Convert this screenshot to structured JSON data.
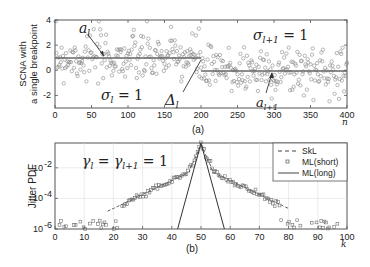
{
  "chart_data": [
    {
      "panel": "(a)",
      "type": "scatter",
      "ylabel": "SCNA with a single breakpoint",
      "xlabel": "n",
      "xlim": [
        0,
        400
      ],
      "ylim": [
        -3,
        4
      ],
      "xticks": [
        0,
        50,
        100,
        150,
        200,
        250,
        300,
        350,
        400
      ],
      "yticks": [
        -2,
        0,
        2,
        4
      ],
      "series": [
        {
          "name": "observations",
          "marker": "circle",
          "description": "noisy samples around piecewise-constant level"
        },
        {
          "name": "segment level l",
          "x": [
            0,
            200
          ],
          "y": [
            1,
            1
          ]
        },
        {
          "name": "segment level l+1",
          "x": [
            200,
            400
          ],
          "y": [
            0,
            0
          ]
        }
      ],
      "annotations": [
        {
          "text": "a_l",
          "points_to": [
            70,
            1
          ]
        },
        {
          "text": "σ_l = 1",
          "at": [
            100,
            -2
          ]
        },
        {
          "text": "Δ_l",
          "points_to": [
            200,
            1
          ]
        },
        {
          "text": "σ_{l+1} = 1",
          "at": [
            310,
            3.4
          ]
        },
        {
          "text": "a_{l+1}",
          "points_to": [
            300,
            0
          ]
        }
      ],
      "caption": "(a)"
    },
    {
      "panel": "(b)",
      "type": "line",
      "ylabel": "Jitter PDF",
      "xlabel": "k",
      "xlim": [
        0,
        100
      ],
      "yscale": "log",
      "ylim": [
        1e-06,
        0.5
      ],
      "xticks": [
        0,
        10,
        20,
        30,
        40,
        50,
        60,
        70,
        80,
        90,
        100
      ],
      "yticks": [
        "10^-6",
        "10^-4",
        "10^-2"
      ],
      "grid": true,
      "legend_position": "upper right",
      "annotation": "γ_l = γ_{l+1} = 1",
      "series": [
        {
          "name": "SkL",
          "style": "dashed",
          "x": [
            20,
            30,
            40,
            45,
            50,
            55,
            60,
            70,
            80
          ],
          "y": [
            1e-06,
            1e-05,
            0.001,
            0.008,
            0.4,
            0.008,
            0.001,
            1e-05,
            1e-06
          ]
        },
        {
          "name": "ML(short)",
          "style": "square-markers",
          "x": [
            2,
            6,
            10,
            14,
            18,
            22,
            26,
            30,
            35,
            40,
            45,
            50,
            55,
            60,
            65,
            70,
            74,
            78,
            82,
            86,
            90,
            94,
            97
          ],
          "y": [
            1e-06,
            2e-06,
            1e-06,
            1e-06,
            2e-06,
            4e-06,
            1.5e-05,
            4e-05,
            0.0002,
            0.001,
            0.008,
            0.4,
            0.008,
            0.001,
            0.0002,
            4e-05,
            1.5e-05,
            4e-06,
            2e-06,
            1e-06,
            1e-06,
            2e-06,
            1e-06
          ]
        },
        {
          "name": "ML(long)",
          "style": "solid",
          "x": [
            42,
            50,
            58
          ],
          "y": [
            1e-06,
            0.4,
            1e-06
          ]
        }
      ],
      "caption": "(b)"
    }
  ],
  "labels": {
    "a_ylabel_line1": "SCNA with",
    "a_ylabel_line2": "a single breakpoint",
    "a_xlabel": "n",
    "a_caption": "(a)",
    "b_ylabel": "Jitter PDF",
    "b_xlabel": "k",
    "b_caption": "(b)",
    "ann_al": "a",
    "ann_al_sub": "l",
    "ann_sigma_l": "σ",
    "ann_sigma_l_sub": "l",
    "ann_eq1": " = 1",
    "ann_delta": "Δ",
    "ann_delta_sub": "l",
    "ann_sigma_l1": "σ",
    "ann_sigma_l1_sub": "l+1",
    "ann_a_l1": "a",
    "ann_a_l1_sub": "l+1",
    "ann_gamma": "γ",
    "ann_gamma_sub1": "l",
    "ann_gamma_mid": " = γ",
    "ann_gamma_sub2": "l+1",
    "legend": [
      "SkL",
      "ML(short)",
      "ML(long)"
    ],
    "a_xticks": [
      "0",
      "50",
      "100",
      "150",
      "200",
      "250",
      "300",
      "350",
      "400"
    ],
    "a_yticks": [
      "4",
      "2",
      "0",
      "-2"
    ],
    "b_xticks": [
      "0",
      "10",
      "20",
      "30",
      "40",
      "50",
      "60",
      "70",
      "80",
      "90",
      "100"
    ],
    "b_ytick_base": "10",
    "b_ytick_exp": [
      "-2",
      "-4",
      "-6"
    ]
  }
}
